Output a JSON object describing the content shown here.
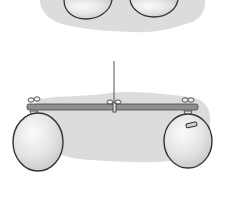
{
  "figure": {
    "colors": {
      "background": "#ffffff",
      "cloud": "#dcdcdc",
      "balloon_fill": "#e6e6e6",
      "outline": "#333333",
      "stick": "#8a8a8a"
    },
    "panels": [
      {
        "id": "top",
        "content": "two balloons (partially cropped)"
      },
      {
        "id": "bottom",
        "content": "balloons hanging from a balanced stick; right balloon has a tape patch"
      }
    ]
  }
}
